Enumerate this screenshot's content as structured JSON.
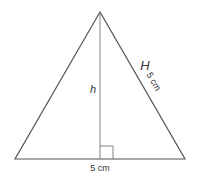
{
  "diagram": {
    "type": "isosceles-triangle",
    "labels": {
      "base_length": "5 cm",
      "height_symbol": "h",
      "slant_symbol": "H",
      "slant_length": "5 cm"
    },
    "geometry": {
      "apex": [
        100,
        12
      ],
      "base_left": [
        15,
        159
      ],
      "base_right": [
        185,
        159
      ],
      "foot": [
        100,
        159
      ],
      "right_angle_size": 13
    },
    "colors": {
      "stroke": "#555555",
      "text": "#333333",
      "background": "#ffffff"
    }
  }
}
